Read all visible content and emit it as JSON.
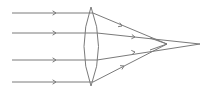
{
  "diagram": {
    "title": "",
    "type": "convex-lens-ray-diagram",
    "colors": {
      "stroke": "#7a7a7a",
      "background": "#ffffff"
    },
    "lens": {
      "top": [
        91,
        7
      ],
      "bottom": [
        91,
        86
      ],
      "left_x": 84,
      "right_x": 99
    },
    "rays": [
      {
        "y": 13,
        "exit": [
          93,
          13
        ],
        "end": [
          167,
          44
        ],
        "arrow_in_x": 56,
        "arrow_out": [
          122,
          26
        ]
      },
      {
        "y": 33,
        "exit": [
          97,
          33
        ],
        "end": [
          200,
          44
        ],
        "arrow_in_x": 56,
        "arrow_out": [
          135,
          37
        ]
      },
      {
        "y": 60,
        "exit": [
          97,
          60
        ],
        "end": [
          200,
          44
        ],
        "arrow_in_x": 56,
        "arrow_out": [
          135,
          52
        ]
      },
      {
        "y": 82,
        "exit": [
          93,
          82
        ],
        "end": [
          167,
          44
        ],
        "arrow_in_x": 56,
        "arrow_out": [
          124,
          66
        ]
      }
    ]
  }
}
